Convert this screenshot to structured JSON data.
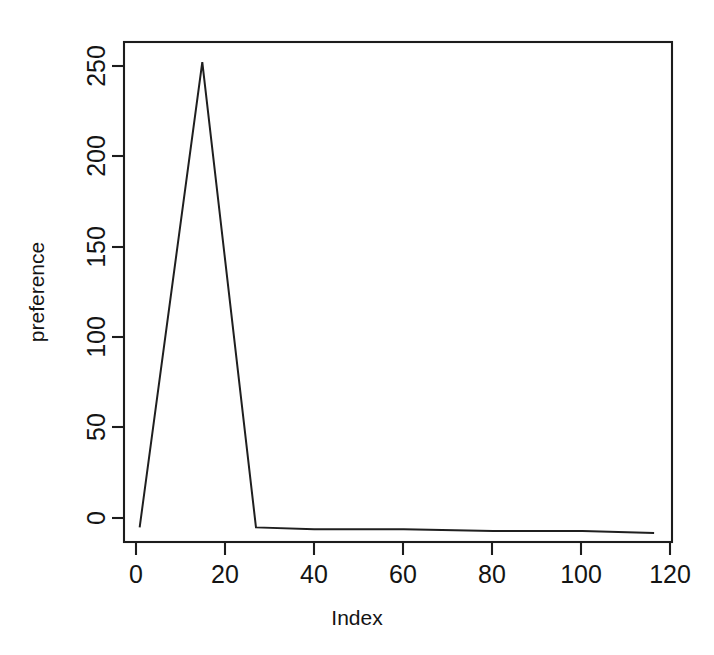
{
  "chart_data": {
    "type": "line",
    "title": "",
    "subtitle": "",
    "xlabel": "Index",
    "ylabel": "preference",
    "xlim": [
      -2.5,
      120.0
    ],
    "ylim": [
      -8,
      266
    ],
    "grid": false,
    "legend": false,
    "legend_position": "none",
    "line_color": "#1f1f1f",
    "background_color": "#ffffff",
    "box_border": true,
    "xticks": [
      0,
      20,
      40,
      60,
      80,
      100,
      120
    ],
    "xtick_labels": [
      "0",
      "20",
      "40",
      "60",
      "80",
      "100",
      "120"
    ],
    "yticks": [
      0,
      50,
      100,
      150,
      200,
      250
    ],
    "ytick_labels": [
      "0",
      "50",
      "100",
      "150",
      "200",
      "250"
    ],
    "series": [
      {
        "name": "preference",
        "x": [
          1,
          15,
          27,
          40,
          60,
          80,
          100,
          116
        ],
        "values": [
          0,
          255,
          0,
          -1,
          -1,
          -2,
          -2,
          -3
        ]
      }
    ],
    "points": [
      {
        "x": 1,
        "y": 0
      },
      {
        "x": 15,
        "y": 255
      },
      {
        "x": 27,
        "y": 0
      },
      {
        "x": 40,
        "y": -1
      },
      {
        "x": 60,
        "y": -1
      },
      {
        "x": 80,
        "y": -2
      },
      {
        "x": 100,
        "y": -2
      },
      {
        "x": 116,
        "y": -3
      }
    ],
    "annotations": []
  },
  "axes": {
    "x_title": "Index",
    "y_title": "preference"
  }
}
